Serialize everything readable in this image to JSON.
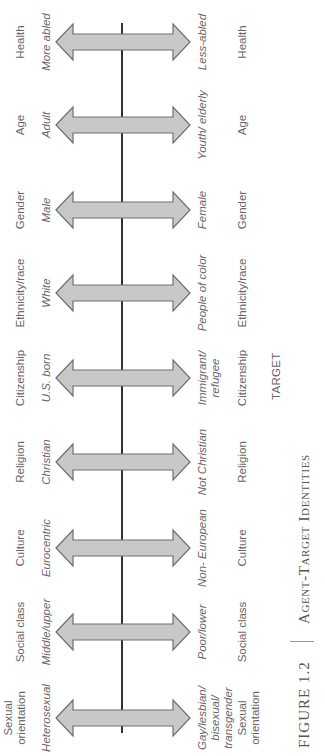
{
  "figure": {
    "number": "FIGURE 1.2",
    "title": "Agent-Target Identities",
    "target_header": "TARGET"
  },
  "colors": {
    "arrow_fill": "#c8c9c6",
    "arrow_stroke": "#6e6e6e",
    "axis_line": "#333333",
    "text": "#666666"
  },
  "dimensions": [
    {
      "category_top": "Sexual orientation",
      "agent": "Heterosexual",
      "target": "Gay/lesbian/ bisexual/ transgender",
      "category_bottom": "Sexual orientation"
    },
    {
      "category_top": "Social class",
      "agent": "Middle/upper",
      "target": "Poor/lower",
      "category_bottom": "Social class"
    },
    {
      "category_top": "Culture",
      "agent": "Eurocentric",
      "target": "Non- European",
      "category_bottom": "Culture"
    },
    {
      "category_top": "Religion",
      "agent": "Christian",
      "target": "Not Christian",
      "category_bottom": "Religion"
    },
    {
      "category_top": "Citizenship",
      "agent": "U.S. born",
      "target": "Immigrant/ refugee",
      "category_bottom": "Citizenship"
    },
    {
      "category_top": "Ethnicity/race",
      "agent": "White",
      "target": "People of color",
      "category_bottom": "Ethnicity/race"
    },
    {
      "category_top": "Gender",
      "agent": "Male",
      "target": "Female",
      "category_bottom": "Gender"
    },
    {
      "category_top": "Age",
      "agent": "Adult",
      "target": "Youth/ elderly",
      "category_bottom": "Age"
    },
    {
      "category_top": "Health",
      "agent": "More abled",
      "target": "Less-abled",
      "category_bottom": "Health"
    }
  ]
}
